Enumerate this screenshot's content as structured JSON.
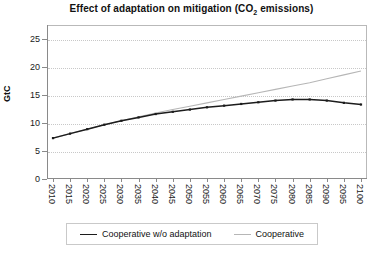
{
  "chart_data": {
    "type": "line",
    "title": "Effect of adaptation on mitigation (CO2 emissions)",
    "title_main": "Effect of adaptation on mitigation (CO",
    "title_sub": "2",
    "title_tail": " emissions)",
    "xlabel": "",
    "ylabel": "GtC",
    "ylim": [
      0,
      27.5
    ],
    "yticks": [
      0,
      5,
      10,
      15,
      20,
      25
    ],
    "ytick_labels": [
      "0",
      "5",
      "10",
      "15",
      "20",
      "25"
    ],
    "grid": true,
    "grid_axis": "y",
    "legend_position": "bottom",
    "x": [
      2010,
      2015,
      2020,
      2025,
      2030,
      2035,
      2040,
      2045,
      2050,
      2055,
      2060,
      2065,
      2070,
      2075,
      2080,
      2085,
      2090,
      2095,
      2100
    ],
    "categories": [
      "2010",
      "2015",
      "2020",
      "2025",
      "2030",
      "2035",
      "2040",
      "2045",
      "2050",
      "2055",
      "2060",
      "2065",
      "2070",
      "2075",
      "2080",
      "2085",
      "2090",
      "2095",
      "2100"
    ],
    "series": [
      {
        "name": "Cooperative w/o adaptation",
        "color": "#1c1c1c",
        "style": "solid-dark",
        "values": [
          7.3,
          8.1,
          8.9,
          9.7,
          10.4,
          11.0,
          11.6,
          12.0,
          12.4,
          12.8,
          13.1,
          13.4,
          13.7,
          14.0,
          14.2,
          14.2,
          14.0,
          13.6,
          13.3
        ]
      },
      {
        "name": "Cooperative",
        "color": "#b6b6b6",
        "style": "solid-light",
        "values": [
          7.3,
          8.1,
          8.9,
          9.7,
          10.4,
          11.1,
          11.8,
          12.4,
          13.0,
          13.6,
          14.2,
          14.8,
          15.4,
          16.0,
          16.6,
          17.2,
          17.9,
          18.6,
          19.3
        ]
      }
    ]
  },
  "legend": {
    "entries": [
      {
        "label": "Cooperative w/o adaptation"
      },
      {
        "label": "Cooperative"
      }
    ]
  }
}
